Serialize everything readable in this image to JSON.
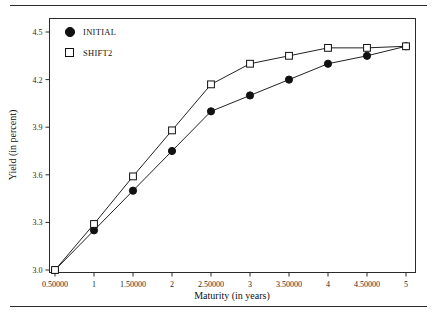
{
  "figure": {
    "rules": {
      "top_label": "top-rule",
      "bottom_label": "bottom-rule"
    }
  },
  "chart_data": {
    "type": "line",
    "title": "",
    "subtitle": "",
    "xlabel": "Maturity (in years)",
    "ylabel": "Yield (in percent)",
    "xlim": [
      0.5,
      5
    ],
    "ylim": [
      3.0,
      4.5
    ],
    "grid": false,
    "legend_position": "top-left",
    "x": [
      0.5,
      1,
      1.5,
      2,
      2.5,
      3,
      3.5,
      4,
      4.5,
      5
    ],
    "xtick_labels": [
      "0.50000",
      "1",
      "1.50000",
      "2",
      "2.50000",
      "3",
      "3.50000",
      "4",
      "4.50000",
      "5"
    ],
    "ytick_values": [
      3.0,
      3.3,
      3.6,
      3.9,
      4.2,
      4.5
    ],
    "ytick_labels": [
      "3.0",
      "3.3",
      "3.6",
      "3.9",
      "4.2",
      "4.5"
    ],
    "series": [
      {
        "name": "INITIAL",
        "marker": "filled-circle",
        "color": "#111111",
        "values": [
          3.0,
          3.25,
          3.5,
          3.75,
          4.0,
          4.1,
          4.2,
          4.3,
          4.35,
          4.41
        ]
      },
      {
        "name": "SHIFT2",
        "marker": "open-square",
        "color": "#111111",
        "values": [
          3.0,
          3.29,
          3.59,
          3.88,
          4.17,
          4.3,
          4.35,
          4.4,
          4.4,
          4.41
        ]
      }
    ]
  }
}
